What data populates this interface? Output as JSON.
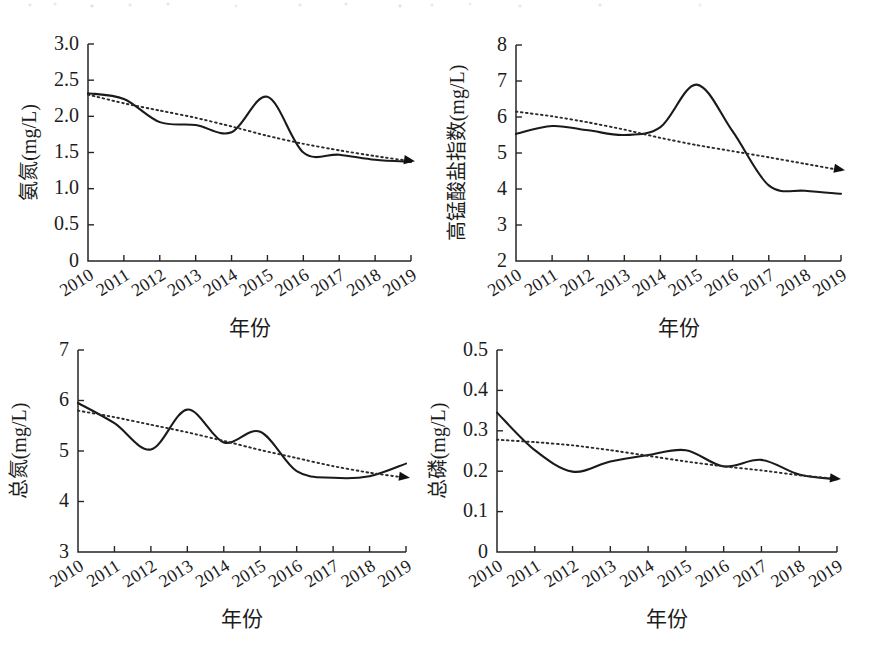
{
  "figure": {
    "panel_count": 4,
    "x_axis_label": "年份",
    "x_categories": [
      "2010",
      "2011",
      "2012",
      "2013",
      "2014",
      "2015",
      "2016",
      "2017",
      "2018",
      "2019"
    ]
  },
  "chart_data": [
    {
      "type": "line",
      "title": "",
      "panel_id": "ammonia-nitrogen",
      "ylabel": "氨氮(mg/L)",
      "xlabel": "年份",
      "ylim": [
        0,
        3.0
      ],
      "yticks": [
        "0",
        "0.5",
        "1.0",
        "1.5",
        "2.0",
        "2.5",
        "3.0"
      ],
      "ytick_values": [
        0,
        0.5,
        1.0,
        1.5,
        2.0,
        2.5,
        3.0
      ],
      "x": [
        "2010",
        "2011",
        "2012",
        "2013",
        "2014",
        "2015",
        "2016",
        "2017",
        "2018",
        "2019"
      ],
      "xticks": [
        "2010",
        "2011",
        "2012",
        "2013",
        "2014",
        "2015",
        "2016",
        "2017",
        "2018",
        "2019"
      ],
      "grid": false,
      "legend": "none",
      "series": [
        {
          "name": "实测值",
          "style": "solid",
          "values": [
            2.32,
            2.24,
            1.92,
            1.88,
            1.78,
            2.27,
            1.5,
            1.47,
            1.4,
            1.37
          ]
        },
        {
          "name": "趋势线",
          "style": "dotted",
          "arrow_end": true,
          "values": [
            2.3,
            2.18,
            2.08,
            1.98,
            1.86,
            1.73,
            1.62,
            1.53,
            1.45,
            1.38
          ]
        }
      ]
    },
    {
      "type": "line",
      "title": "",
      "panel_id": "permanganate-index",
      "ylabel": "高锰酸盐指数(mg/L)",
      "xlabel": "年份",
      "ylim": [
        2,
        8
      ],
      "yticks": [
        "2",
        "3",
        "4",
        "5",
        "6",
        "7",
        "8"
      ],
      "ytick_values": [
        2,
        3,
        4,
        5,
        6,
        7,
        8
      ],
      "x": [
        "2010",
        "2011",
        "2012",
        "2013",
        "2014",
        "2015",
        "2016",
        "2017",
        "2018",
        "2019"
      ],
      "xticks": [
        "2010",
        "2011",
        "2012",
        "2013",
        "2014",
        "2015",
        "2016",
        "2017",
        "2018",
        "2019"
      ],
      "grid": false,
      "legend": "none",
      "series": [
        {
          "name": "实测值",
          "style": "solid",
          "values": [
            5.53,
            5.75,
            5.63,
            5.5,
            5.72,
            6.9,
            5.6,
            4.1,
            3.95,
            3.87
          ]
        },
        {
          "name": "趋势线",
          "style": "dotted",
          "arrow_end": true,
          "values": [
            6.15,
            6.02,
            5.85,
            5.65,
            5.42,
            5.22,
            5.05,
            4.88,
            4.7,
            4.52
          ]
        }
      ]
    },
    {
      "type": "line",
      "title": "",
      "panel_id": "total-nitrogen",
      "ylabel": "总氮(mg/L)",
      "xlabel": "年份",
      "ylim": [
        3,
        7
      ],
      "yticks": [
        "3",
        "4",
        "5",
        "6",
        "7"
      ],
      "ytick_values": [
        3,
        4,
        5,
        6,
        7
      ],
      "x": [
        "2010",
        "2011",
        "2012",
        "2013",
        "2014",
        "2015",
        "2016",
        "2017",
        "2018",
        "2019"
      ],
      "xticks": [
        "2010",
        "2011",
        "2012",
        "2013",
        "2014",
        "2015",
        "2016",
        "2017",
        "2018",
        "2019"
      ],
      "grid": false,
      "legend": "none",
      "series": [
        {
          "name": "实测值",
          "style": "solid",
          "values": [
            5.95,
            5.55,
            5.03,
            5.82,
            5.17,
            5.38,
            4.6,
            4.47,
            4.5,
            4.75
          ]
        },
        {
          "name": "趋势线",
          "style": "dotted",
          "arrow_end": true,
          "values": [
            5.8,
            5.67,
            5.52,
            5.37,
            5.2,
            5.02,
            4.86,
            4.7,
            4.57,
            4.47
          ]
        }
      ]
    },
    {
      "type": "line",
      "title": "",
      "panel_id": "total-phosphorus",
      "ylabel": "总磷(mg/L)",
      "xlabel": "年份",
      "ylim": [
        0,
        0.5
      ],
      "yticks": [
        "0",
        "0.1",
        "0.2",
        "0.3",
        "0.4",
        "0.5"
      ],
      "ytick_values": [
        0,
        0.1,
        0.2,
        0.3,
        0.4,
        0.5
      ],
      "x": [
        "2010",
        "2011",
        "2012",
        "2013",
        "2014",
        "2015",
        "2016",
        "2017",
        "2018",
        "2019"
      ],
      "xticks": [
        "2010",
        "2011",
        "2012",
        "2013",
        "2014",
        "2015",
        "2016",
        "2017",
        "2018",
        "2019"
      ],
      "grid": false,
      "legend": "none",
      "series": [
        {
          "name": "实测值",
          "style": "solid",
          "values": [
            0.345,
            0.252,
            0.199,
            0.224,
            0.24,
            0.252,
            0.212,
            0.228,
            0.192,
            0.18
          ]
        },
        {
          "name": "趋势线",
          "style": "dotted",
          "arrow_end": true,
          "values": [
            0.278,
            0.272,
            0.264,
            0.252,
            0.238,
            0.224,
            0.212,
            0.202,
            0.19,
            0.181
          ]
        }
      ]
    }
  ]
}
